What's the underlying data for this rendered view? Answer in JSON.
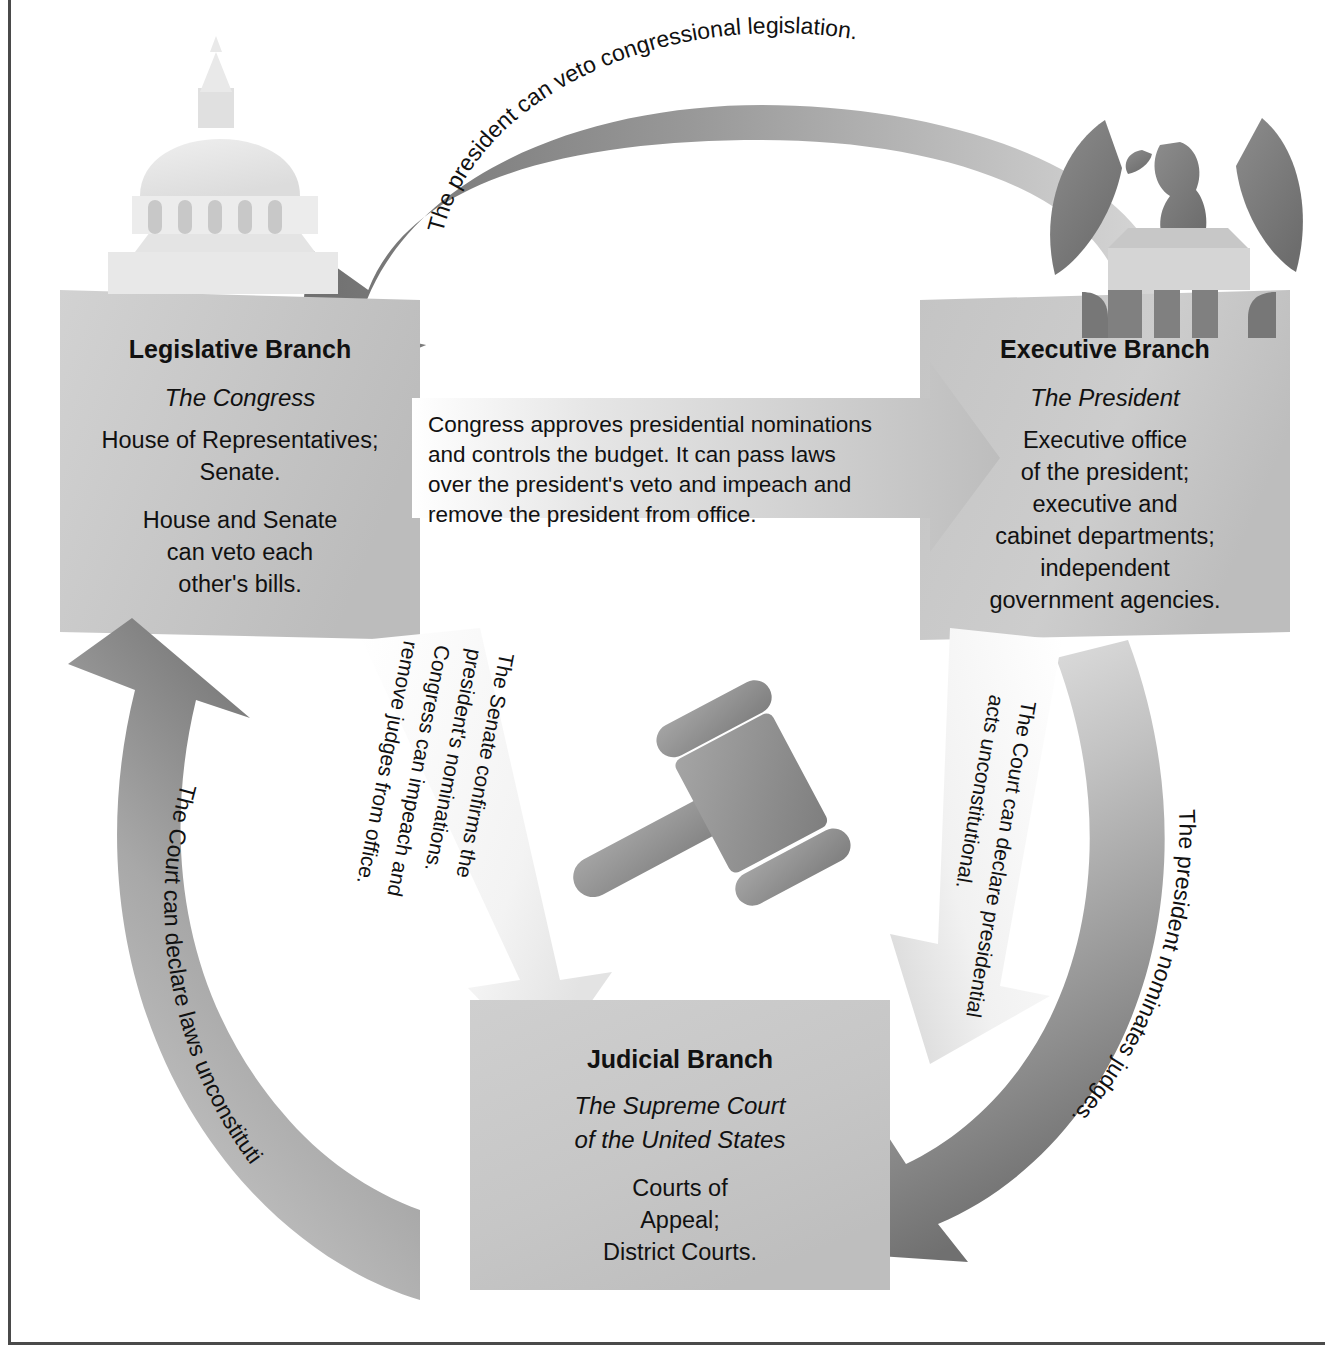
{
  "diagram": {
    "background_color": "#ffffff",
    "frame_color": "#4a4a4a"
  },
  "boxes": {
    "legislative": {
      "title": "Legislative Branch",
      "subtitle": "The Congress",
      "icon": "capitol-dome-icon",
      "fill": "#c9c9c9",
      "lines": [
        "House of Representatives;",
        "Senate.",
        "",
        "House and Senate",
        "can veto each",
        "other's bills."
      ]
    },
    "executive": {
      "title": "Executive Branch",
      "subtitle": "The President",
      "icon": "eagle-icon",
      "fill": "#c9c9c9",
      "lines": [
        "Executive office",
        "of the president;",
        "executive and",
        "cabinet departments;",
        "independent",
        "government agencies."
      ]
    },
    "judicial": {
      "title": "Judicial Branch",
      "subtitle_line1": "The Supreme Court",
      "subtitle_line2": "of the United States",
      "icon": "gavel-icon",
      "fill": "#c9c9c9",
      "lines": [
        "Courts of",
        "Appeal;",
        "District Courts."
      ]
    }
  },
  "arrows": {
    "president_veto": {
      "label": "The president can veto congressional legislation.",
      "from": "executive",
      "to": "legislative",
      "shade": "dark"
    },
    "congress_approves": {
      "from": "legislative",
      "to": "executive",
      "shade": "light",
      "lines": [
        "Congress approves presidential nominations",
        "and controls the budget.  It can pass laws",
        "over the president's veto and impeach and",
        "remove the president from office."
      ]
    },
    "court_laws": {
      "label": "The Court can declare laws unconstitutional.",
      "from": "judicial",
      "to": "legislative",
      "shade": "dark"
    },
    "senate_confirms": {
      "from": "legislative",
      "to": "judicial",
      "shade": "white",
      "lines": [
        "The Senate confirms the",
        "president's nominations.",
        "Congress can impeach and",
        "remove judges from office."
      ]
    },
    "court_acts": {
      "from": "judicial",
      "to": "executive",
      "shade": "white",
      "lines": [
        "The Court can declare presidential",
        "acts unconstitutional."
      ]
    },
    "president_nominates": {
      "label": "The president nominates judges.",
      "from": "executive",
      "to": "judicial",
      "shade": "medium"
    }
  }
}
